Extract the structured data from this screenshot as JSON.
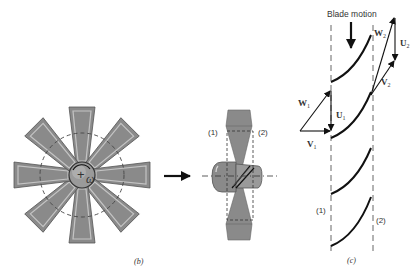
{
  "figure_b": {
    "caption": "(b)",
    "omega_label": "ω",
    "center_mark": "+",
    "blade_count": 8,
    "colors": {
      "blade": "#8a8a8a",
      "blade_edge": "#b8b8b8",
      "hub": "#9a9a9a"
    }
  },
  "side_view": {
    "station_1": "(1)",
    "station_2": "(2)",
    "flow_arrow": "flow-direction-arrow"
  },
  "figure_c": {
    "caption": "(c)",
    "blade_motion_label": "Blade motion",
    "station_1": "(1)",
    "station_2": "(2)",
    "vectors": {
      "W1": "W",
      "W1_sub": "1",
      "U1": "U",
      "U1_sub": "1",
      "V1": "V",
      "V1_sub": "1",
      "W2": "W",
      "W2_sub": "2",
      "U2": "U",
      "U2_sub": "2",
      "V2": "V",
      "V2_sub": "2"
    }
  }
}
